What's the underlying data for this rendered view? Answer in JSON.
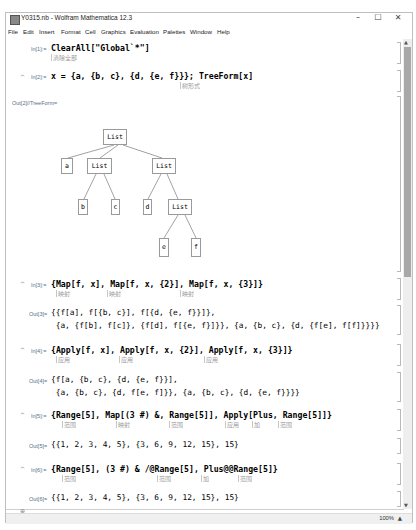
{
  "window": {
    "title": "Y0315.nb - Wolfram Mathematica 12.3",
    "icon": "mathematica-notebook-icon",
    "controls": {
      "minimize": "–",
      "maximize": "☐",
      "close": "✕"
    }
  },
  "menubar": {
    "items": [
      "File",
      "Edit",
      "Insert",
      "Format",
      "Cell",
      "Graphics",
      "Evaluation",
      "Palettes",
      "Window",
      "Help"
    ]
  },
  "cells": [
    {
      "in_label": "In[1]:=",
      "input": "ClearAll[\"Global`*\"]",
      "hints": [
        "清除全部"
      ]
    },
    {
      "in_label": "In[2]:=",
      "input": "x = {a, {b, c}, {d, {e, f}}}; TreeForm[x]",
      "hints": [
        "树形式"
      ],
      "out_label": "Out[2]//TreeForm=",
      "tree": {
        "nodes": [
          "List",
          "a",
          "List",
          "List",
          "b",
          "c",
          "d",
          "List",
          "e",
          "f"
        ]
      }
    },
    {
      "in_label": "In[3]:=",
      "input": "{Map[f, x], Map[f, x, {2}], Map[f, x, {3}]}",
      "hints": [
        "映射",
        "映射",
        "映射"
      ],
      "out_label": "Out[3]=",
      "output_lines": [
        "{{f[a], f[{b, c}], f[{d, {e, f}}]},",
        " {a, {f[b], f[c]}, {f[d], f[{e, f}]}}, {a, {b, c}, {d, {f[e], f[f]}}}}"
      ]
    },
    {
      "in_label": "In[4]:=",
      "input": "{Apply[f, x], Apply[f, x, {2}], Apply[f, x, {3}]}",
      "hints": [
        "应用",
        "应用",
        "应用"
      ],
      "out_label": "Out[4]=",
      "output_lines": [
        "{f[a, {b, c}, {d, {e, f}}],",
        " {a, {b, c}, {d, f[e, f]}}, {a, {b, c}, {d, {e, f}}}}"
      ]
    },
    {
      "in_label": "In[5]:=",
      "input": "{Range[5], Map[(3 #) &, Range[5]], Apply[Plus, Range[5]]}",
      "hints": [
        "范围",
        "映射",
        "范围",
        "应用",
        "加",
        "范围"
      ],
      "out_label": "Out[5]=",
      "output_lines": [
        "{{1, 2, 3, 4, 5}, {3, 6, 9, 12, 15}, 15}"
      ]
    },
    {
      "in_label": "In[6]:=",
      "input": "{Range[5], (3 #) & /@Range[5], Plus@@Range[5]}",
      "hints": [
        "范围",
        "范围",
        "加",
        "范围"
      ],
      "out_label": "Out[6]=",
      "output_lines": [
        "{{1, 2, 3, 4, 5}, {3, 6, 9, 12, 15}, 15}"
      ]
    }
  ],
  "opener_glyph": "^",
  "status": {
    "zoom": "100%",
    "zoom_arrow": "▲"
  },
  "scroll": {
    "up": "▲",
    "down": "▼"
  }
}
